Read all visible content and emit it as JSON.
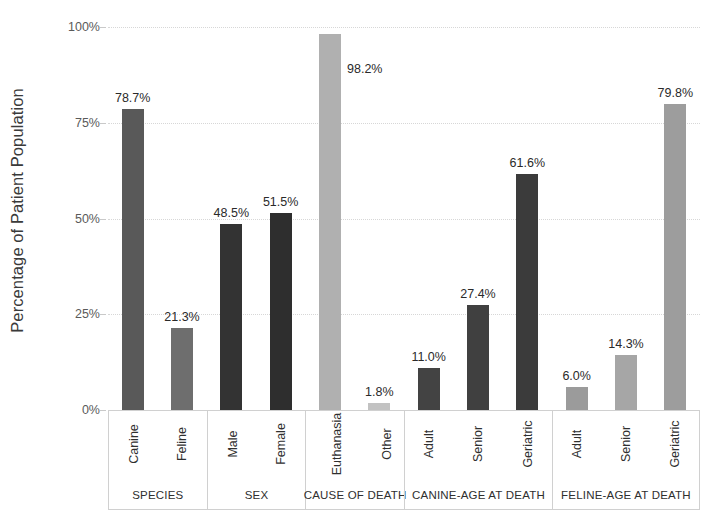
{
  "chart_data": {
    "type": "bar",
    "title": "",
    "xlabel": "",
    "ylabel": "Percentage of Patient Population",
    "ylim": [
      0,
      100
    ],
    "ytick_labels": [
      "0%",
      "25%",
      "50%",
      "75%",
      "100%"
    ],
    "ytick_values": [
      0,
      25,
      50,
      75,
      100
    ],
    "grid": true,
    "legend": "none",
    "categories": [
      "Canine",
      "Feline",
      "Male",
      "Female",
      "Euthanasia",
      "Other",
      "Adult",
      "Senior",
      "Geriatric",
      "Adult",
      "Senior",
      "Geriatric"
    ],
    "values": [
      78.7,
      21.3,
      48.5,
      51.5,
      98.2,
      1.8,
      11.0,
      27.4,
      61.6,
      6.0,
      14.3,
      79.8
    ],
    "data_labels": [
      "78.7%",
      "21.3%",
      "48.5%",
      "51.5%",
      "98.2%",
      "1.8%",
      "11.0%",
      "27.4%",
      "61.6%",
      "6.0%",
      "14.3%",
      "79.8%"
    ],
    "groups": [
      {
        "name": "SPECIES",
        "bars": [
          {
            "label": "Canine",
            "value": 78.7,
            "data_label": "78.7%",
            "color": "#595959",
            "label_position": "above"
          },
          {
            "label": "Feline",
            "value": 21.3,
            "data_label": "21.3%",
            "color": "#6e6e6e",
            "label_position": "above"
          }
        ]
      },
      {
        "name": "SEX",
        "bars": [
          {
            "label": "Male",
            "value": 48.5,
            "data_label": "48.5%",
            "color": "#333333",
            "label_position": "above"
          },
          {
            "label": "Female",
            "value": 51.5,
            "data_label": "51.5%",
            "color": "#2e2e2e",
            "label_position": "above"
          }
        ]
      },
      {
        "name": "CAUSE OF DEATH",
        "bars": [
          {
            "label": "Euthanasia",
            "value": 98.2,
            "data_label": "98.2%",
            "color": "#b0b0b0",
            "label_position": "right"
          },
          {
            "label": "Other",
            "value": 1.8,
            "data_label": "1.8%",
            "color": "#c2c2c2",
            "label_position": "above"
          }
        ]
      },
      {
        "name": "CANINE-AGE AT DEATH",
        "bars": [
          {
            "label": "Adult",
            "value": 11.0,
            "data_label": "11.0%",
            "color": "#434343",
            "label_position": "above"
          },
          {
            "label": "Senior",
            "value": 27.4,
            "data_label": "27.4%",
            "color": "#404040",
            "label_position": "above"
          },
          {
            "label": "Geriatric",
            "value": 61.6,
            "data_label": "61.6%",
            "color": "#3b3b3b",
            "label_position": "above"
          }
        ]
      },
      {
        "name": "FELINE-AGE AT DEATH",
        "bars": [
          {
            "label": "Adult",
            "value": 6.0,
            "data_label": "6.0%",
            "color": "#9b9b9b",
            "label_position": "above"
          },
          {
            "label": "Senior",
            "value": 14.3,
            "data_label": "14.3%",
            "color": "#a6a6a6",
            "label_position": "above"
          },
          {
            "label": "Geriatric",
            "value": 79.8,
            "data_label": "79.8%",
            "color": "#9d9d9d",
            "label_position": "above"
          }
        ]
      }
    ]
  },
  "style": {
    "background": "#ffffff",
    "gridline_color": "#d7d7d7",
    "axis_color": "#c8c8c8",
    "text_color": "#2f2f2f",
    "table_border": "#d0d0d0"
  }
}
